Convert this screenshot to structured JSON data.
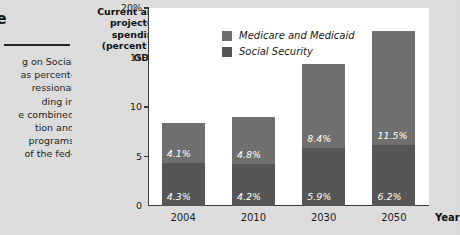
{
  "article": {
    "heading_fragment": "f the",
    "body_lines": [
      "g on Social",
      "as percent-",
      "ressional",
      "ding in",
      "e combined",
      "tion and",
      " programs",
      "of the fed-"
    ]
  },
  "chart_data": {
    "type": "bar",
    "stacked": true,
    "title_lines": [
      "Current and",
      "projected",
      "spending",
      "(percent of",
      "GDP)"
    ],
    "title": "Current and projected spending (percent of GDP)",
    "categories": [
      "2004",
      "2010",
      "2030",
      "2050"
    ],
    "series": [
      {
        "name": "Social Security",
        "values": [
          4.3,
          4.2,
          5.9,
          6.2
        ],
        "color": "#565656"
      },
      {
        "name": "Medicare and Medicaid",
        "values": [
          4.1,
          4.8,
          8.4,
          11.5
        ],
        "color": "#6f6f6f"
      }
    ],
    "value_labels": {
      "Social Security": [
        "4.3%",
        "4.2%",
        "5.9%",
        "6.2%"
      ],
      "Medicare and Medicaid": [
        "4.1%",
        "4.8%",
        "8.4%",
        "11.5%"
      ]
    },
    "totals": [
      8.4,
      9.0,
      14.3,
      17.7
    ],
    "ylabel": "Current and projected spending (percent of GDP)",
    "xlabel": "Year",
    "ylim": [
      0,
      20
    ],
    "yticks": [
      "0",
      "5",
      "10",
      "15",
      "20%"
    ],
    "ytick_values": [
      0,
      5,
      10,
      15,
      20
    ],
    "grid": false,
    "legend_position": "inside-top-left",
    "plot_background": "#ffffff",
    "figure_background": "#dcdcdc"
  }
}
